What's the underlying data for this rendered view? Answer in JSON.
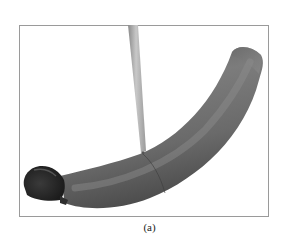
{
  "figure": {
    "panel_label": "(a)",
    "content": "3D rendered curved tube with inserted rod",
    "colors": {
      "frame": "#9a9a9a",
      "tube_light": "#8a8a8a",
      "tube_mid": "#6e6e6e",
      "tube_dark": "#4a4a4a",
      "tube_end_cap": "#2a2a2a",
      "rod_light": "#c4c4c4",
      "rod_dark": "#8e8e8e",
      "background": "#ffffff"
    }
  }
}
